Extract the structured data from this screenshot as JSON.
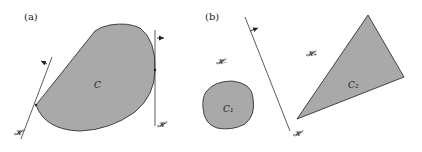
{
  "panels": {
    "a": {
      "label": "(a)",
      "set_label": "C",
      "hyperplane_left_label": "𝓗",
      "hyperplane_right_label": "𝓗"
    },
    "b": {
      "label": "(b)",
      "set1_label": "C₁",
      "set2_label": "C₂",
      "halfspace_minus_label": "𝓗₋",
      "halfspace_plus_label": "𝓗₊",
      "hyperplane_label": "𝓗"
    }
  },
  "colors": {
    "fill": "#a9a9a9",
    "stroke": "#333333",
    "background": "#ffffff"
  }
}
